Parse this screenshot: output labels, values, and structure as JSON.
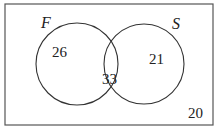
{
  "diagram": {
    "type": "venn",
    "sets": [
      {
        "label": "F",
        "only_count": "26"
      },
      {
        "label": "S",
        "only_count": "21"
      }
    ],
    "intersection_count": "33",
    "outside_count": "20",
    "colors": {
      "stroke": "#333333",
      "background": "#ffffff",
      "border": "#555555"
    }
  }
}
